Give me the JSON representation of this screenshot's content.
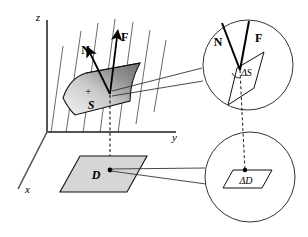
{
  "figure": {
    "background_color": "#ffffff",
    "line_color": "#000000",
    "axes": {
      "z_label": "z",
      "y_label": "y",
      "x_label": "x"
    },
    "surface": {
      "label": "S",
      "orientation_marker": "+",
      "fill_light": "#f2f2f2",
      "fill_dark": "#7a7a7a"
    },
    "vectors": {
      "normal_label": "N",
      "field_label": "F"
    },
    "region": {
      "label": "D",
      "fill": "#d9d9d9"
    },
    "insets": {
      "upper": {
        "patch_label": "ΔS",
        "normal_label": "N",
        "field_label": "F"
      },
      "lower": {
        "patch_label": "ΔD"
      }
    },
    "field_lines_count": 7
  }
}
